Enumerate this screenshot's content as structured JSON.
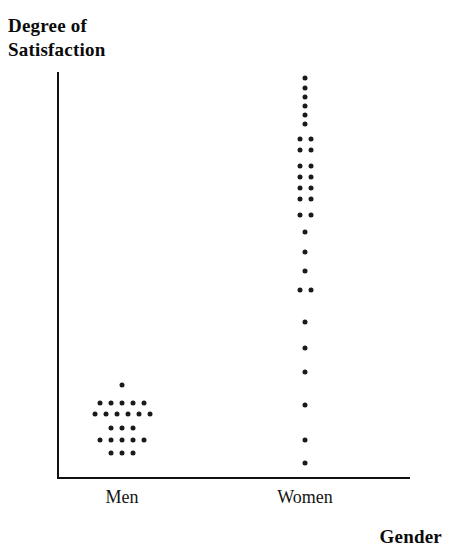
{
  "chart_data": {
    "type": "scatter",
    "title": "",
    "xlabel": "Gender",
    "ylabel": "Degree of\nSatisfaction",
    "categories": [
      "Men",
      "Women"
    ],
    "grid": false,
    "legend": null,
    "axis": {
      "x_origin_px": 57,
      "x_end_px": 410,
      "y_top_px": 72,
      "y_bottom_px": 477,
      "y_axis_ticks": [],
      "x_axis_ticks": [
        "Men",
        "Women"
      ]
    },
    "series": [
      {
        "name": "Men",
        "center_x_px": 122,
        "count": 23,
        "rows": [
          {
            "y_px": 385,
            "n": 1
          },
          {
            "y_px": 403,
            "n": 5
          },
          {
            "y_px": 414,
            "n": 6
          },
          {
            "y_px": 428,
            "n": 3
          },
          {
            "y_px": 440,
            "n": 5
          },
          {
            "y_px": 453,
            "n": 3
          }
        ]
      },
      {
        "name": "Women",
        "center_x_px": 305,
        "count": 34,
        "rows": [
          {
            "y_px": 78,
            "n": 1
          },
          {
            "y_px": 88,
            "n": 1
          },
          {
            "y_px": 97,
            "n": 1
          },
          {
            "y_px": 106,
            "n": 1
          },
          {
            "y_px": 115,
            "n": 1
          },
          {
            "y_px": 124,
            "n": 1
          },
          {
            "y_px": 139,
            "n": 2
          },
          {
            "y_px": 150,
            "n": 2
          },
          {
            "y_px": 166,
            "n": 2
          },
          {
            "y_px": 177,
            "n": 2
          },
          {
            "y_px": 188,
            "n": 2
          },
          {
            "y_px": 199,
            "n": 2
          },
          {
            "y_px": 215,
            "n": 2
          },
          {
            "y_px": 232,
            "n": 1
          },
          {
            "y_px": 252,
            "n": 1
          },
          {
            "y_px": 271,
            "n": 1
          },
          {
            "y_px": 290,
            "n": 2
          },
          {
            "y_px": 322,
            "n": 1
          },
          {
            "y_px": 348,
            "n": 1
          },
          {
            "y_px": 372,
            "n": 1
          },
          {
            "y_px": 405,
            "n": 1
          },
          {
            "y_px": 440,
            "n": 1
          },
          {
            "y_px": 463,
            "n": 1
          }
        ]
      }
    ],
    "dot_spacing_px": 11,
    "dot_radius_px": 2.5
  }
}
